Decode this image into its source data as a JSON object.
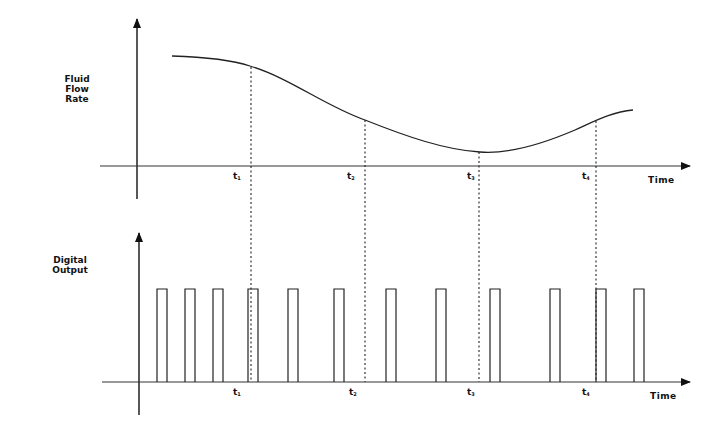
{
  "top_panel": {
    "y_label_lines": [
      "Fluid",
      "Flow",
      "Rate"
    ],
    "x_label": "Time",
    "ticks": [
      {
        "name": "t",
        "sub": "1"
      },
      {
        "name": "t",
        "sub": "2"
      },
      {
        "name": "t",
        "sub": "3"
      },
      {
        "name": "t",
        "sub": "4"
      }
    ]
  },
  "bottom_panel": {
    "y_label_lines": [
      "Digital",
      "Output"
    ],
    "x_label": "Time",
    "ticks": [
      {
        "name": "t",
        "sub": "1"
      },
      {
        "name": "t",
        "sub": "2"
      },
      {
        "name": "t",
        "sub": "3"
      },
      {
        "name": "t",
        "sub": "4"
      }
    ]
  },
  "chart_data": [
    {
      "type": "line",
      "title": "",
      "xlabel": "Time",
      "ylabel": "Fluid Flow Rate",
      "categories": [
        "start",
        "t1",
        "t2",
        "t3",
        "min",
        "t4",
        "end"
      ],
      "values": [
        0.89,
        0.81,
        0.38,
        0.12,
        0.11,
        0.36,
        0.44
      ],
      "grid": false,
      "annotations": [
        "dashed vertical lines at t1, t2, t3, t4 extending into Digital Output panel"
      ]
    },
    {
      "type": "bar",
      "title": "",
      "xlabel": "Time",
      "ylabel": "Digital Output",
      "description": "Pulse train of 12 equal-height rectangular pulses; spacing widens as flow rate decreases (around t3) and narrows as it increases",
      "pulse_x_positions_px": [
        157,
        185,
        213,
        248,
        288,
        334,
        386,
        436,
        490,
        550,
        596,
        634
      ],
      "pulse_height": 1,
      "grid": false
    }
  ]
}
